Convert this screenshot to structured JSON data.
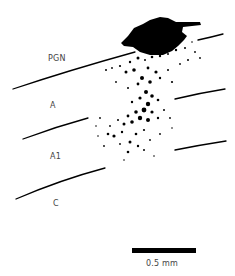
{
  "figure": {
    "layer_labels": [
      "PGN",
      "A",
      "A1",
      "C"
    ],
    "scale_bar": {
      "label": "0.5 mm"
    },
    "colors": {
      "ink": "#000000",
      "label": "#444444",
      "background": "#ffffff"
    }
  }
}
